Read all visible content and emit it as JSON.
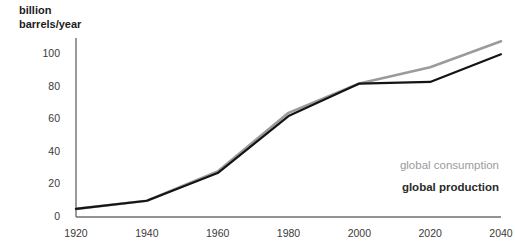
{
  "chart_data": {
    "type": "line",
    "title": "",
    "ylabel": "billion\nbarrels/year",
    "ylabel_line1": "billion",
    "ylabel_line2": "barrels/year",
    "xlabel": "",
    "x": [
      1920,
      1940,
      1960,
      1980,
      2000,
      2020,
      2040
    ],
    "xlim": [
      1920,
      2040
    ],
    "ylim": [
      0,
      110
    ],
    "xticks": [
      "1920",
      "1940",
      "1960",
      "1980",
      "2000",
      "2020",
      "2040"
    ],
    "yticks": [
      "0",
      "20",
      "40",
      "60",
      "80",
      "100"
    ],
    "ytick_values": [
      0,
      20,
      40,
      60,
      80,
      100
    ],
    "grid": false,
    "legend_position": "inside-right",
    "series": [
      {
        "name": "global consumption",
        "color": "#9b9b9b",
        "values": [
          5,
          10,
          28,
          64,
          82,
          92,
          108
        ]
      },
      {
        "name": "global production",
        "color": "#141414",
        "values": [
          5,
          10,
          27,
          62,
          82,
          83,
          100
        ]
      }
    ]
  },
  "legend": {
    "consumption_label": "global consumption",
    "production_label": "global production"
  },
  "colors": {
    "axis": "#6f6f6f",
    "consumption": "#9b9b9b",
    "production": "#141414",
    "text": "#3a3a3a",
    "background": "#ffffff"
  }
}
